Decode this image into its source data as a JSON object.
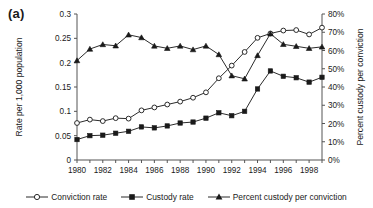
{
  "panel": {
    "label": "(a)"
  },
  "legend": {
    "items": [
      {
        "label": "Conviction rate",
        "marker": "open-circle-icon"
      },
      {
        "label": "Custody rate",
        "marker": "filled-square-icon"
      },
      {
        "label": "Percent custody per conviction",
        "marker": "filled-triangle-icon"
      }
    ]
  },
  "chart_data": {
    "type": "line",
    "title": "",
    "xlabel": "Year",
    "ylabel": "Rate per 1,000 population",
    "y2label": "Percent custody per conviction",
    "grid": false,
    "legend_position": "bottom",
    "x": [
      1980,
      1981,
      1982,
      1983,
      1984,
      1985,
      1986,
      1987,
      1988,
      1989,
      1990,
      1991,
      1992,
      1993,
      1994,
      1995,
      1996,
      1997,
      1998,
      1999
    ],
    "xlim": [
      1980,
      1999
    ],
    "xticks": [
      1980,
      1982,
      1984,
      1986,
      1988,
      1990,
      1992,
      1994,
      1996,
      1998
    ],
    "xticklabels": [
      "1980",
      "1982",
      "1984",
      "1986",
      "1988",
      "1990",
      "1992",
      "1994",
      "1996",
      "1998"
    ],
    "ylim": [
      0,
      0.3
    ],
    "yticks": [
      0,
      0.05,
      0.1,
      0.15,
      0.2,
      0.25,
      0.3
    ],
    "yticklabels": [
      "0",
      "0.05",
      "0.1",
      "0.15",
      "0.2",
      "0.25",
      "0.3"
    ],
    "y2lim": [
      0,
      80
    ],
    "y2ticks": [
      0,
      10,
      20,
      30,
      40,
      50,
      60,
      70,
      80
    ],
    "y2ticklabels": [
      "0%",
      "10%",
      "20%",
      "30%",
      "40%",
      "50%",
      "60%",
      "70%",
      "80%"
    ],
    "series": [
      {
        "name": "Conviction rate",
        "axis": "left",
        "marker": "open-circle",
        "values": [
          0.076,
          0.083,
          0.08,
          0.086,
          0.085,
          0.102,
          0.108,
          0.114,
          0.12,
          0.128,
          0.139,
          0.168,
          0.194,
          0.222,
          0.251,
          0.26,
          0.266,
          0.267,
          0.258,
          0.272
        ]
      },
      {
        "name": "Custody rate",
        "axis": "left",
        "marker": "filled-square",
        "values": [
          0.042,
          0.05,
          0.051,
          0.055,
          0.059,
          0.068,
          0.066,
          0.07,
          0.076,
          0.078,
          0.086,
          0.097,
          0.091,
          0.1,
          0.146,
          0.183,
          0.172,
          0.169,
          0.16,
          0.17
        ]
      },
      {
        "name": "Percent custody per conviction",
        "axis": "right",
        "marker": "filled-triangle",
        "values": [
          54.5,
          60.8,
          63.3,
          62.6,
          68.6,
          67.1,
          62.5,
          61.2,
          62.5,
          60.5,
          62.5,
          57.8,
          46.2,
          44.5,
          57.3,
          69.2,
          63.4,
          62.3,
          61.2,
          62.0
        ]
      }
    ]
  }
}
